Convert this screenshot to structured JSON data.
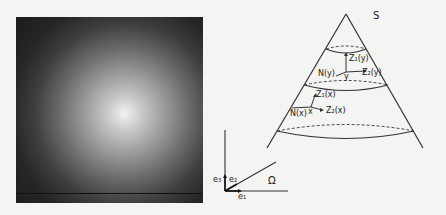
{
  "figure": {
    "left_panel": {
      "type": "radial-gradient-image",
      "description": "bright center fading to dark edges"
    },
    "cone": {
      "surface_label": "S",
      "upper_point": {
        "name": "y",
        "normal": "N(y)",
        "tangent1": "Z₁(y)",
        "tangent2": "Z₂(y)"
      },
      "lower_point": {
        "name": "x",
        "normal": "N(x)",
        "tangent1": "Z₁(x)",
        "tangent2": "Z₂(x)"
      }
    },
    "axes": {
      "e1": "e₁",
      "e2": "e₂",
      "e3": "e₃",
      "domain": "Ω"
    }
  }
}
